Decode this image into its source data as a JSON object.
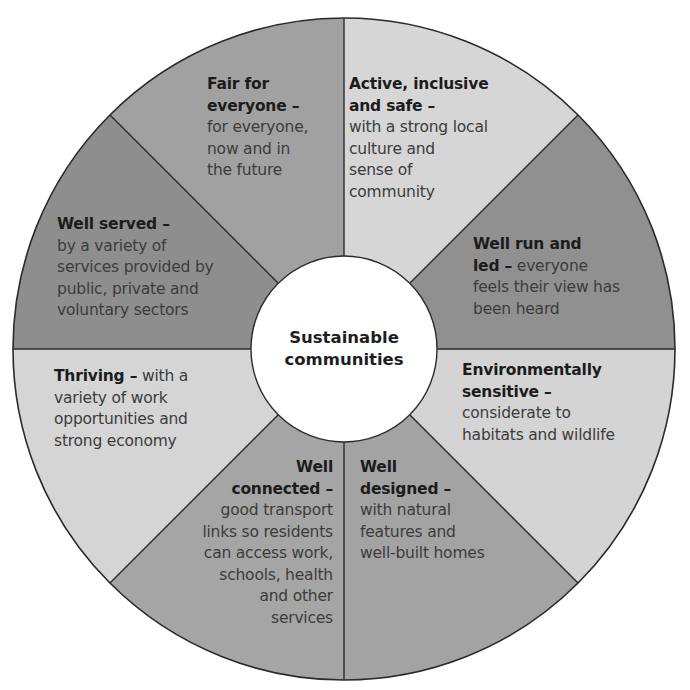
{
  "diagram": {
    "type": "segmented-wheel",
    "center_label": {
      "line1": "Sustainable",
      "line2": "communities"
    },
    "colors": {
      "dark": "#8f8f8f",
      "medium": "#a3a3a3",
      "light": "#d5d5d5",
      "center": "#ffffff",
      "outline": "#2a2a2a"
    },
    "segments": [
      {
        "id": "fair-for-everyone",
        "title_lines": [
          "Fair for",
          "everyone –"
        ],
        "desc_lines": [
          "for everyone,",
          "now and in",
          "the future"
        ],
        "shade": "medium"
      },
      {
        "id": "active-inclusive-safe",
        "title_lines": [
          "Active, inclusive",
          "and safe –"
        ],
        "desc_lines": [
          "with a strong local",
          "culture and",
          "sense of",
          "community"
        ],
        "shade": "light"
      },
      {
        "id": "well-run-and-led",
        "title_lines": [
          "Well run and",
          "led –"
        ],
        "desc_inline": "everyone",
        "desc_lines": [
          "feels their view has",
          "been heard"
        ],
        "shade": "dark"
      },
      {
        "id": "environmentally-sensitive",
        "title_lines": [
          "Environmentally",
          "sensitive –"
        ],
        "desc_lines": [
          "considerate to",
          "habitats and wildlife"
        ],
        "shade": "light"
      },
      {
        "id": "well-designed",
        "title_lines": [
          "Well",
          "designed –"
        ],
        "desc_lines": [
          "with natural",
          "features and",
          "well-built homes"
        ],
        "shade": "medium"
      },
      {
        "id": "well-connected",
        "title_lines": [
          "Well",
          "connected –"
        ],
        "desc_lines": [
          "good transport",
          "links so residents",
          "can access work,",
          "schools, health",
          "and other",
          "services"
        ],
        "shade": "medium"
      },
      {
        "id": "thriving",
        "title_lines": [
          "Thriving –"
        ],
        "desc_inline": "with a",
        "desc_lines": [
          "variety of work",
          "opportunities and",
          "strong economy"
        ],
        "shade": "light"
      },
      {
        "id": "well-served",
        "title_lines": [
          "Well served –"
        ],
        "desc_lines": [
          "by a variety of",
          "services provided by",
          "public, private and",
          "voluntary sectors"
        ],
        "shade": "dark"
      }
    ]
  }
}
